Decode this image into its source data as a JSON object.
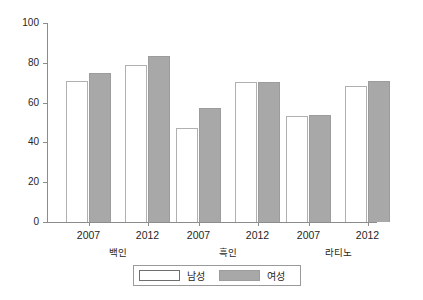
{
  "chart_data": {
    "type": "bar",
    "title": "",
    "xlabel": "",
    "ylabel": "보고된 인터넷 접속률",
    "ylim": [
      0,
      100
    ],
    "yticks": [
      0,
      20,
      40,
      60,
      80,
      100
    ],
    "grid": false,
    "legend_position": "bottom",
    "groups": [
      "백인",
      "흑인",
      "라티노"
    ],
    "categories": [
      "2007",
      "2012",
      "2007",
      "2012",
      "2007",
      "2012"
    ],
    "series": [
      {
        "name": "남성",
        "color": "#ffffff",
        "values": [
          71,
          79,
          47,
          70.5,
          53.5,
          68.5
        ]
      },
      {
        "name": "여성",
        "color": "#a8a8a8",
        "values": [
          75,
          83.5,
          57.5,
          70.5,
          54,
          71
        ]
      }
    ]
  },
  "axis": {
    "y_ticks": [
      {
        "label": "100",
        "value": 100
      },
      {
        "label": "80",
        "value": 80
      },
      {
        "label": "60",
        "value": 60
      },
      {
        "label": "40",
        "value": 40
      },
      {
        "label": "20",
        "value": 20
      },
      {
        "label": "0",
        "value": 0
      }
    ],
    "y_title": "보고된 인터넷 접속률"
  },
  "x_axis": {
    "ticks": [
      {
        "year": "2007",
        "group": "백인"
      },
      {
        "year": "2012",
        "group": "백인"
      },
      {
        "year": "2007",
        "group": "흑인"
      },
      {
        "year": "2012",
        "group": "흑인"
      },
      {
        "year": "2007",
        "group": "라티노"
      },
      {
        "year": "2012",
        "group": "라티노"
      }
    ],
    "group_labels": [
      "백인",
      "흑인",
      "라티노"
    ]
  },
  "legend": {
    "items": [
      {
        "label": "남성",
        "swatch": "white-bar-swatch"
      },
      {
        "label": "여성",
        "swatch": "gray-bar-swatch"
      }
    ]
  }
}
